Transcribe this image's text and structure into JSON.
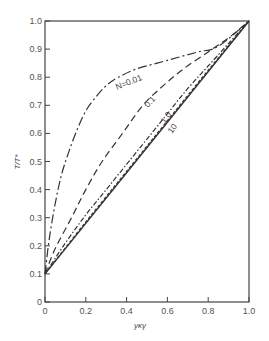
{
  "chart_data": {
    "type": "line",
    "title": "",
    "xlabel": "yκγ",
    "ylabel": "T/T*",
    "xlim": [
      0,
      1.0
    ],
    "ylim": [
      0,
      1.0
    ],
    "grid": false,
    "legend_position": "inline labels on curves",
    "x_ticks": [
      "0",
      "0.2",
      "0.4",
      "0.6",
      "0.8",
      "1.0"
    ],
    "y_ticks": [
      "0",
      "0.1",
      "0.2",
      "0.3",
      "0.4",
      "0.5",
      "0.6",
      "0.7",
      "0.8",
      "0.9",
      "1.0"
    ],
    "series": [
      {
        "name": "N=0.01",
        "label": "N=0.01",
        "style": "dash-dot",
        "x": [
          0,
          0.02,
          0.05,
          0.08,
          0.11,
          0.15,
          0.2,
          0.25,
          0.3,
          0.36,
          0.45,
          0.55,
          0.65,
          0.75,
          0.85,
          1.0
        ],
        "y": [
          0.1,
          0.22,
          0.35,
          0.45,
          0.52,
          0.6,
          0.68,
          0.73,
          0.77,
          0.8,
          0.83,
          0.85,
          0.87,
          0.89,
          0.91,
          1.0
        ]
      },
      {
        "name": "N=0.1",
        "label": "0.1",
        "style": "dashed",
        "x": [
          0,
          0.05,
          0.13,
          0.2,
          0.28,
          0.38,
          0.48,
          0.58,
          0.68,
          0.8,
          0.9,
          1.0
        ],
        "y": [
          0.1,
          0.19,
          0.3,
          0.4,
          0.5,
          0.6,
          0.7,
          0.77,
          0.83,
          0.89,
          0.94,
          1.0
        ]
      },
      {
        "name": "N=1.0",
        "label": "1.0",
        "style": "short-dashed",
        "x": [
          0,
          0.1,
          0.2,
          0.3,
          0.4,
          0.5,
          0.6,
          0.7,
          0.8,
          0.9,
          1.0
        ],
        "y": [
          0.1,
          0.21,
          0.31,
          0.4,
          0.49,
          0.58,
          0.67,
          0.76,
          0.84,
          0.92,
          1.0
        ]
      },
      {
        "name": "N=10",
        "label": "10",
        "style": "fine-dashed",
        "x": [
          0,
          0.2,
          0.4,
          0.6,
          0.8,
          1.0
        ],
        "y": [
          0.1,
          0.285,
          0.465,
          0.645,
          0.825,
          1.0
        ]
      },
      {
        "name": "limit (straight line)",
        "label": "",
        "style": "solid",
        "x": [
          0,
          1.0
        ],
        "y": [
          0.1,
          1.0
        ]
      }
    ]
  },
  "labels": {
    "curve_n001": "N=0.01",
    "curve_n01": "0.1",
    "curve_n1": "1.0",
    "curve_n10": "10",
    "xlabel": "yκγ",
    "ylabel": "T/T*"
  },
  "ticks": {
    "x": [
      "0",
      "0.2",
      "0.4",
      "0.6",
      "0.8",
      "1.0"
    ],
    "y": [
      "0",
      "0.1",
      "0.2",
      "0.3",
      "0.4",
      "0.5",
      "0.6",
      "0.7",
      "0.8",
      "0.9",
      "1.0"
    ]
  },
  "colors": {
    "line": "#333333",
    "text": "#555555"
  }
}
